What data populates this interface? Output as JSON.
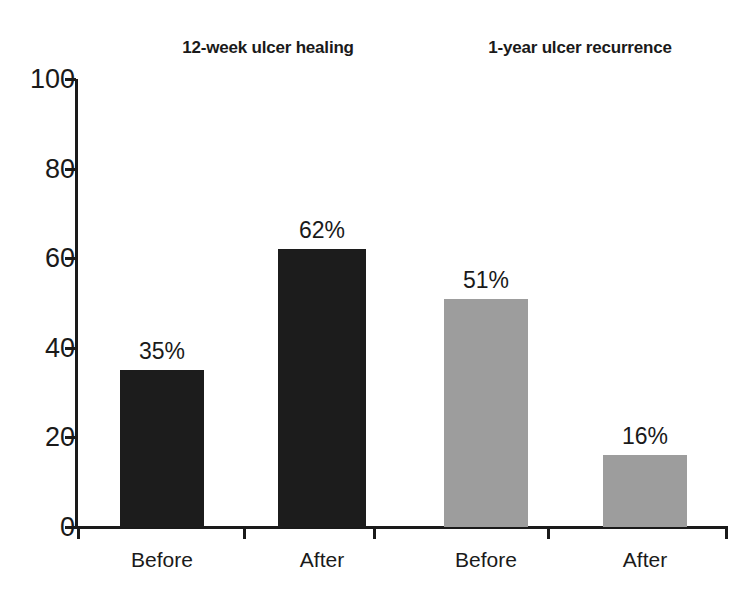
{
  "chart_data": {
    "type": "bar",
    "title": "",
    "subtitle": "",
    "xlabel": "",
    "ylabel": "",
    "ylim": [
      0,
      100
    ],
    "yticks": [
      0,
      20,
      40,
      60,
      80,
      100
    ],
    "ytick_labels": [
      "0",
      "20",
      "40",
      "60",
      "80",
      "100"
    ],
    "grid": false,
    "legend": false,
    "categories": [
      "Before",
      "After",
      "Before",
      "After"
    ],
    "values": [
      35,
      62,
      51,
      16
    ],
    "data_labels": [
      "35%",
      "62%",
      "51%",
      "16%"
    ],
    "bar_colors": [
      "#1c1c1c",
      "#1c1c1c",
      "#9d9d9d",
      "#9d9d9d"
    ],
    "groups": [
      {
        "label": "12-week ulcer healing",
        "center_x": 268,
        "bars": [
          {
            "category": "Before",
            "value": 35,
            "label": "35%",
            "color": "#1c1c1c",
            "left": 120,
            "width": 84
          },
          {
            "category": "After",
            "value": 62,
            "label": "62%",
            "color": "#1c1c1c",
            "left": 278,
            "width": 88
          }
        ]
      },
      {
        "label": "1-year ulcer recurrence",
        "center_x": 580,
        "bars": [
          {
            "category": "Before",
            "value": 51,
            "label": "51%",
            "color": "#9d9d9d",
            "left": 444,
            "width": 84
          },
          {
            "category": "After",
            "value": 16,
            "label": "16%",
            "color": "#9d9d9d",
            "left": 603,
            "width": 84
          }
        ]
      }
    ],
    "x_tick_positions": [
      77,
      243,
      373,
      547,
      725
    ],
    "axis_color": "#1a1a1a",
    "background_color": "#ffffff"
  }
}
